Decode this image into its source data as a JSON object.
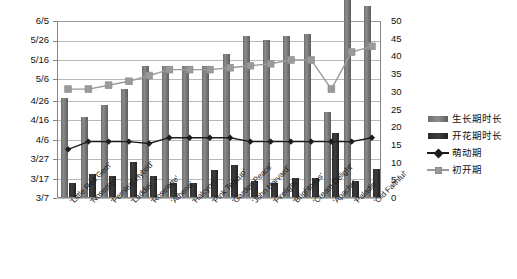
{
  "chart_data": {
    "type": "bar",
    "title": "",
    "subtitle": "",
    "xlabel": "",
    "ylabel": "",
    "y2label": "",
    "grid": true,
    "legend_position": "right",
    "categories": [
      "'Little Red Gem'",
      "'Nosegay'",
      "'Fernleaf Hybrid'",
      "'Laddie'",
      "'Roselette'",
      "'Athena'",
      "'Halcyon'",
      "'Pink Teacup'",
      "'Garden Peace'",
      "'John Harvard'",
      "'Firelight'",
      "'Brightness'",
      "'Cream Delight'",
      "'Apache'",
      "'Paladin'",
      "'Old Faithful'"
    ],
    "left_axis": {
      "type": "date",
      "ticks": [
        "3/7",
        "3/17",
        "3/27",
        "4/6",
        "4/16",
        "4/26",
        "5/6",
        "5/16",
        "5/26",
        "6/5"
      ],
      "min": "3/7",
      "max": "6/5"
    },
    "right_axis": {
      "type": "numeric",
      "ticks": [
        0,
        5,
        10,
        15,
        20,
        25,
        30,
        35,
        40,
        45,
        50
      ],
      "ylim": [
        0,
        50
      ]
    },
    "series": [
      {
        "name": "生长期时长",
        "kind": "bar",
        "axis": "right",
        "color": "#7a7a7a",
        "values": [
          28,
          22.5,
          26,
          30.5,
          37,
          37,
          37,
          37,
          40.5,
          45.5,
          44.5,
          45.5,
          46,
          24,
          56,
          54
        ]
      },
      {
        "name": "开花期时长",
        "kind": "bar",
        "axis": "right",
        "color": "#2b2b2b",
        "values": [
          4,
          6.5,
          6,
          10,
          6,
          4,
          4,
          7.5,
          9,
          4.5,
          4,
          5.5,
          5.5,
          18,
          4.5,
          8
        ]
      },
      {
        "name": "萌动期",
        "kind": "line",
        "axis": "left",
        "color": "#1d1d1d",
        "marker": "diamond",
        "values": [
          "4/1",
          "4/5",
          "4/5",
          "4/5",
          "4/4",
          "4/7",
          "4/7",
          "4/7",
          "4/7",
          "4/5",
          "4/5",
          "4/5",
          "4/5",
          "4/5",
          "4/5",
          "4/7"
        ]
      },
      {
        "name": "初开期",
        "kind": "line",
        "axis": "left",
        "color": "#9a9a9a",
        "marker": "square",
        "values": [
          "5/1",
          "5/1",
          "5/3",
          "5/5",
          "5/8",
          "5/11",
          "5/11",
          "5/11",
          "5/12",
          "5/13",
          "5/14",
          "5/16",
          "5/16",
          "5/1",
          "5/20",
          "5/23"
        ]
      }
    ]
  },
  "legend": {
    "items": [
      {
        "label": "生长期时长",
        "key": "bar-growth"
      },
      {
        "label": "开花期时长",
        "key": "bar-flower"
      },
      {
        "label": "萌动期",
        "key": "line-diamond"
      },
      {
        "label": "初开期",
        "key": "line-square"
      }
    ]
  },
  "colors": {
    "bar_growth": "#7a7a7a",
    "bar_flower": "#2b2b2b",
    "line_budbreak": "#1d1d1d",
    "line_firstbloom": "#9a9a9a",
    "grid": "#b9b9b9",
    "axis": "#868686",
    "background": "#ffffff"
  }
}
